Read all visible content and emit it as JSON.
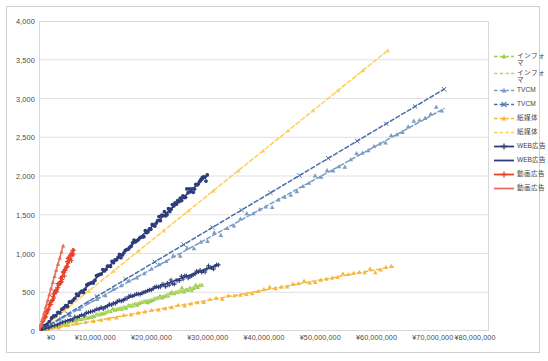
{
  "chart_data": {
    "type": "scatter",
    "title": "",
    "xlabel": "",
    "ylabel": "",
    "xlim": [
      0,
      80000000
    ],
    "ylim": [
      0,
      4000
    ],
    "grid": "horizontal",
    "legend_position": "right",
    "x_ticks": [
      "¥0",
      "¥10,000,000",
      "¥20,000,000",
      "¥30,000,000",
      "¥40,000,000",
      "¥50,000,000",
      "¥60,000,000",
      "¥70,000,000",
      "¥80,000,000"
    ],
    "x_tick_values": [
      0,
      10000000,
      20000000,
      30000000,
      40000000,
      50000000,
      60000000,
      70000000,
      80000000
    ],
    "y_ticks": [
      "0",
      "500",
      "1,000",
      "1,500",
      "2,000",
      "2,500",
      "3,000",
      "3,500",
      "4,000"
    ],
    "y_tick_values": [
      0,
      500,
      1000,
      1500,
      2000,
      2500,
      3000,
      3500,
      4000
    ],
    "series": [
      {
        "name": "インフォマ",
        "marker": "triangle",
        "style": "dashed",
        "color": "#9ACD4E",
        "kind": "scatter",
        "slope": 2.05e-05,
        "x_end": 29000000,
        "y_end": 595,
        "n": 70,
        "jitter": 28
      },
      {
        "name": "インフォマ",
        "marker": "line",
        "style": "dashed",
        "color": "#B5D96B",
        "kind": "trend",
        "slope": 2.05e-05,
        "x_end": 29000000,
        "y_end": 595
      },
      {
        "name": "TVCM",
        "marker": "triangle",
        "style": "dashed",
        "color": "#7A9BC4",
        "kind": "scatter",
        "slope": 3.99e-05,
        "x_end": 72000000,
        "y_end": 2870,
        "n": 60,
        "jitter": 55
      },
      {
        "name": "TVCM",
        "marker": "cross",
        "style": "dashed",
        "color": "#4A6FA8",
        "kind": "trend",
        "slope": 4.33e-05,
        "x_end": 72000000,
        "y_end": 3120
      },
      {
        "name": "紙媒体",
        "marker": "triangle",
        "style": "dashed",
        "color": "#F5B83D",
        "kind": "scatter",
        "slope": 1.32e-05,
        "x_end": 63000000,
        "y_end": 830,
        "n": 55,
        "jitter": 26
      },
      {
        "name": "紙媒体",
        "marker": "line",
        "style": "dashed",
        "color": "#FFCE54",
        "kind": "trend",
        "slope": 5.84e-05,
        "x_end": 62000000,
        "y_end": 3620
      },
      {
        "name": "WEB広告",
        "marker": "plus",
        "style": "solid",
        "color": "#2E3D7A",
        "kind": "scatter",
        "slope": 2.68e-05,
        "x_end": 32000000,
        "y_end": 860,
        "n": 90,
        "jitter": 34
      },
      {
        "name": "WEB広告",
        "marker": "line",
        "style": "solid",
        "color": "#2E3D7A",
        "kind": "scatter2",
        "slope": 6.72e-05,
        "x_end": 30000000,
        "y_end": 2015,
        "n": 110,
        "jitter": 46
      },
      {
        "name": "動画広告",
        "marker": "plus",
        "style": "solid",
        "color": "#E8432A",
        "kind": "scatter",
        "slope": 0.00017,
        "x_end": 6200000,
        "y_end": 1055,
        "n": 80,
        "jitter": 60
      },
      {
        "name": "動画広告",
        "marker": "line",
        "style": "solid",
        "color": "#E8705C",
        "kind": "trend",
        "slope": 0.000255,
        "x_end": 4300000,
        "y_end": 1100
      }
    ]
  }
}
